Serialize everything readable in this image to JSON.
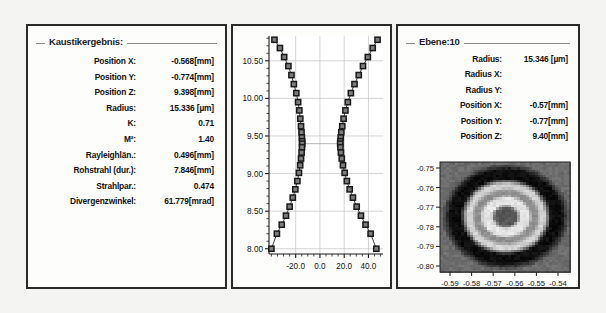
{
  "window": {
    "background_color": "#f4f4f2",
    "panel_background": "#fdfdfc",
    "panel_border_color": "#2a2a2a"
  },
  "caustic_panel": {
    "title": "Kaustikergebnis:",
    "rows": [
      {
        "label": "Position X:",
        "value": "-0.568[mm]"
      },
      {
        "label": "Position Y:",
        "value": "-0.774[mm]"
      },
      {
        "label": "Position Z:",
        "value": "9.398[mm]"
      },
      {
        "label": "Radius:",
        "value": "15.336 [µm]"
      },
      {
        "label": "K:",
        "value": "0.71"
      },
      {
        "label": "M²:",
        "value": "1.40"
      },
      {
        "label": "Rayleighlän.:",
        "value": "0.496[mm]"
      },
      {
        "label": "Rohstrahl (dur.):",
        "value": "7.846[mm]"
      },
      {
        "label": "Strahlpar.:",
        "value": "0.474"
      },
      {
        "label": "Divergenzwinkel:",
        "value": "61.779[mrad]"
      }
    ]
  },
  "plane_panel": {
    "title": "Ebene:10",
    "rows": [
      {
        "label": "Radius:",
        "value": "15.346 [µm]"
      },
      {
        "label": "Radius X:",
        "value": ""
      },
      {
        "label": "Radius Y:",
        "value": ""
      },
      {
        "label": "Position X:",
        "value": "-0.57[mm]"
      },
      {
        "label": "Position Y:",
        "value": "-0.77[mm]"
      },
      {
        "label": "Position Z:",
        "value": "9.40[mm]"
      }
    ]
  },
  "chart_data": {
    "type": "line",
    "title": "",
    "xlabel": "",
    "ylabel": "",
    "xlim": [
      -42.0,
      52.0
    ],
    "ylim": [
      7.93,
      10.83
    ],
    "grid": true,
    "legend": "none",
    "marker": "square",
    "marker_color": "#1a1a1a",
    "line_color": "#3c3c3c",
    "xticks": [
      -20.0,
      0.0,
      20.0,
      40.0
    ],
    "xticklabels": [
      "-20.0",
      "0.0",
      "20.0",
      "40.0"
    ],
    "yticks": [
      8.0,
      8.5,
      9.0,
      9.5,
      10.0,
      10.5
    ],
    "yticklabels": [
      "8.00",
      "8.50",
      "9.00",
      "9.50",
      "10.00",
      "10.50"
    ],
    "waist_line_y": 9.398,
    "series": [
      {
        "name": "left-branch",
        "x": [
          -37.5,
          -33.0,
          -29.5,
          -26.0,
          -23.5,
          -21.5,
          -19.5,
          -18.0,
          -17.0,
          -16.2,
          -15.6,
          -15.2,
          -14.9,
          -14.7,
          -14.6,
          -14.8,
          -15.1,
          -15.6,
          -16.3,
          -17.3,
          -18.6,
          -20.3,
          -22.4,
          -25.0,
          -28.0,
          -31.5,
          -35.5,
          -40.0
        ],
        "y": [
          10.78,
          10.67,
          10.55,
          10.43,
          10.31,
          10.19,
          10.07,
          9.95,
          9.84,
          9.73,
          9.63,
          9.55,
          9.48,
          9.43,
          9.398,
          9.35,
          9.28,
          9.2,
          9.11,
          9.01,
          8.9,
          8.79,
          8.68,
          8.56,
          8.44,
          8.32,
          8.2,
          8.0
        ]
      },
      {
        "name": "right-branch",
        "x": [
          47.5,
          43.5,
          39.5,
          35.5,
          32.0,
          28.5,
          25.5,
          23.0,
          21.0,
          19.5,
          18.4,
          17.6,
          17.1,
          16.8,
          16.7,
          16.9,
          17.3,
          18.0,
          19.0,
          20.4,
          22.2,
          24.5,
          27.2,
          30.3,
          33.8,
          37.6,
          41.8,
          46.5
        ],
        "y": [
          10.78,
          10.67,
          10.55,
          10.43,
          10.31,
          10.19,
          10.07,
          9.95,
          9.84,
          9.73,
          9.63,
          9.55,
          9.48,
          9.43,
          9.398,
          9.35,
          9.28,
          9.2,
          9.11,
          9.01,
          8.9,
          8.79,
          8.68,
          8.56,
          8.44,
          8.32,
          8.2,
          8.0
        ]
      }
    ]
  },
  "beam_profile": {
    "type": "heatmap",
    "colormap": "grayscale",
    "xticklabels": [
      "-0.59",
      "-0.58",
      "-0.57",
      "-0.56",
      "-0.55",
      "-0.54"
    ],
    "yticklabels": [
      "-0.75",
      "-0.76",
      "-0.77",
      "-0.78",
      "-0.79",
      "-0.80"
    ],
    "xlim": [
      -0.595,
      -0.535
    ],
    "ylim": [
      -0.805,
      -0.745
    ],
    "center_x": -0.57,
    "center_y": -0.77,
    "background_level": "#6e6e6e",
    "ring_dark": "#0e0e0e",
    "ring_bright": "#e8e8e8",
    "core_level": "#585858"
  }
}
